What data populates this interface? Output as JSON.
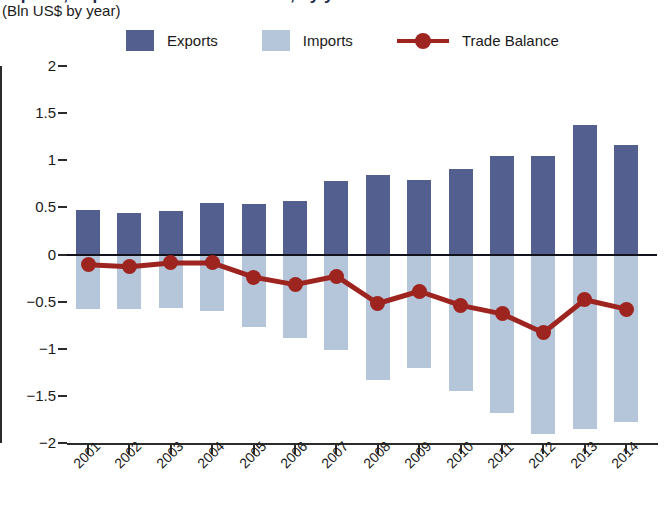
{
  "header": {
    "title": "Exports, Imports and Trade Balance, by year",
    "subtitle": "(Bln US$ by year)"
  },
  "legend": {
    "items": [
      {
        "label": "Exports",
        "type": "swatch",
        "color": "#525f8f"
      },
      {
        "label": "Imports",
        "type": "swatch",
        "color": "#b6c6da"
      },
      {
        "label": "Trade Balance",
        "type": "line",
        "color": "#9e2420"
      }
    ]
  },
  "axes": {
    "y_ticks": [
      "2",
      "1.5",
      "1",
      "0.5",
      "0",
      "-0.5",
      "-1",
      "-1.5",
      "-2"
    ],
    "y_values": [
      2,
      1.5,
      1,
      0.5,
      0,
      -0.5,
      -1,
      -1.5,
      -2
    ],
    "x_ticks": [
      "2001",
      "2002",
      "2003",
      "2004",
      "2005",
      "2006",
      "2007",
      "2008",
      "2009",
      "2010",
      "2011",
      "2012",
      "2013",
      "2014"
    ]
  },
  "chart_data": {
    "type": "bar",
    "title": "Exports, Imports and Trade Balance, by year",
    "subtitle": "(Bln US$ by year)",
    "xlabel": "",
    "ylabel": "Bln US$",
    "ylim": [
      -2,
      2
    ],
    "grid": false,
    "legend_position": "top",
    "categories": [
      "2001",
      "2002",
      "2003",
      "2004",
      "2005",
      "2006",
      "2007",
      "2008",
      "2009",
      "2010",
      "2011",
      "2012",
      "2013",
      "2014"
    ],
    "series": [
      {
        "name": "Exports",
        "type": "bar",
        "color": "#525f8f",
        "values": [
          0.47,
          0.44,
          0.46,
          0.55,
          0.54,
          0.57,
          0.78,
          0.84,
          0.79,
          0.91,
          1.05,
          1.05,
          1.37,
          1.16
        ]
      },
      {
        "name": "Imports",
        "type": "bar",
        "color": "#b6c6da",
        "values": [
          -0.58,
          -0.58,
          -0.57,
          -0.6,
          -0.77,
          -0.89,
          -1.01,
          -1.33,
          -1.2,
          -1.45,
          -1.68,
          -1.9,
          -1.85,
          -1.78
        ]
      },
      {
        "name": "Trade Balance",
        "type": "line",
        "color": "#9e2420",
        "values": [
          -0.11,
          -0.13,
          -0.09,
          -0.09,
          -0.24,
          -0.32,
          -0.23,
          -0.52,
          -0.39,
          -0.54,
          -0.63,
          -0.83,
          -0.48,
          -0.58
        ]
      }
    ]
  }
}
